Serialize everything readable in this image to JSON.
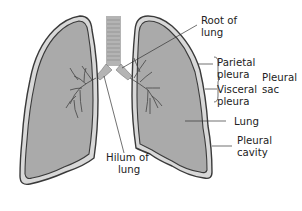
{
  "diagram": {
    "colors": {
      "lung_fill": "#aaaaaa",
      "pleural_cavity": "#d8d8d8",
      "outline": "#3a3a3a",
      "trachea_fill": "#b4b4b4",
      "leader_line": "#333333",
      "text": "#222222"
    },
    "labels": {
      "root_of_lung": [
        "Root of",
        "lung"
      ],
      "parietal_pleura": [
        "Parietal",
        "pleura"
      ],
      "visceral_pleura": [
        "Visceral",
        "pleura"
      ],
      "pleural_sac": [
        "Pleural",
        "sac"
      ],
      "lung": "Lung",
      "pleural_cavity": [
        "Pleural",
        "cavity"
      ],
      "hilum_of_lung": [
        "Hilum of",
        "lung"
      ]
    }
  }
}
